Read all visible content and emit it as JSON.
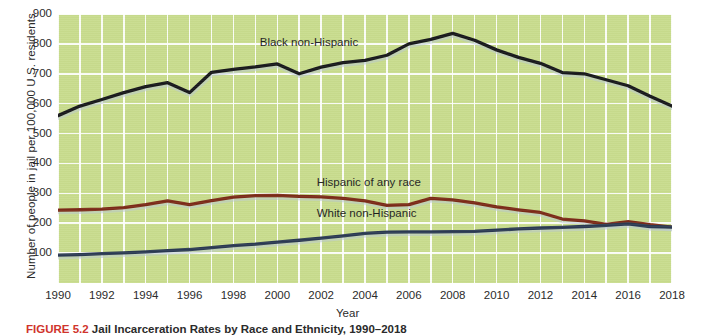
{
  "figure": {
    "caption_number": "FIGURE 5.2",
    "caption_text": "Jail Incarceration Rates by Race and Ethnicity, 1990–2018"
  },
  "chart_data": {
    "type": "line",
    "title": "",
    "xlabel": "Year",
    "ylabel": "Number of people in jail per 100,000 U.S. residents",
    "xlim": [
      1990,
      2018
    ],
    "ylim": [
      0,
      900
    ],
    "yticks": [
      100,
      200,
      300,
      400,
      500,
      600,
      700,
      800,
      900
    ],
    "xticks": [
      1990,
      1992,
      1994,
      1996,
      1998,
      2000,
      2002,
      2004,
      2006,
      2008,
      2010,
      2012,
      2014,
      2016,
      2018
    ],
    "grid": true,
    "legend_position": "inline-labels",
    "plot_background": "#c8dc8d",
    "gridline_color": "#ffffff",
    "x": [
      1990,
      1991,
      1992,
      1993,
      1994,
      1995,
      1996,
      1997,
      1998,
      1999,
      2000,
      2001,
      2002,
      2003,
      2004,
      2005,
      2006,
      2007,
      2008,
      2009,
      2010,
      2011,
      2012,
      2013,
      2014,
      2015,
      2016,
      2017,
      2018
    ],
    "series": [
      {
        "name": "Black non-Hispanic",
        "color": "#17181a",
        "values": [
          560,
          592,
          614,
          637,
          657,
          670,
          637,
          705,
          715,
          723,
          733,
          700,
          722,
          737,
          745,
          762,
          800,
          815,
          835,
          812,
          780,
          755,
          735,
          704,
          700,
          680,
          660,
          625,
          592
        ]
      },
      {
        "name": "Hispanic of any race",
        "color": "#7b2a17",
        "values": [
          244,
          245,
          247,
          252,
          262,
          275,
          262,
          276,
          287,
          292,
          293,
          290,
          288,
          283,
          275,
          260,
          262,
          283,
          278,
          268,
          255,
          245,
          236,
          214,
          208,
          196,
          205,
          195,
          187
        ]
      },
      {
        "name": "White non-Hispanic",
        "color": "#2b3a52",
        "values": [
          93,
          95,
          98,
          101,
          104,
          108,
          112,
          118,
          125,
          130,
          137,
          143,
          150,
          158,
          166,
          170,
          171,
          171,
          172,
          173,
          177,
          181,
          184,
          186,
          189,
          193,
          198,
          189,
          187
        ]
      }
    ]
  },
  "annotations": [
    {
      "name": "black-series-label",
      "text": "Black non-Hispanic"
    },
    {
      "name": "hispanic-series-label",
      "text": "Hispanic of any race"
    },
    {
      "name": "white-series-label",
      "text": "White non-Hispanic"
    }
  ]
}
